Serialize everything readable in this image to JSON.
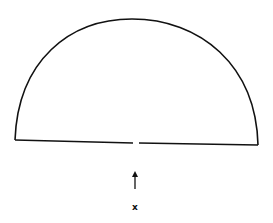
{
  "diagram": {
    "shape": "semicircle",
    "stroke_color": "#111111",
    "background": "#ffffff",
    "baseline": {
      "left_endpoint": [
        15,
        140
      ],
      "right_endpoint": [
        258,
        145
      ],
      "gap_near_center": true
    },
    "arrow": {
      "direction": "up",
      "points_to": "gap in baseline"
    },
    "label": "x"
  }
}
